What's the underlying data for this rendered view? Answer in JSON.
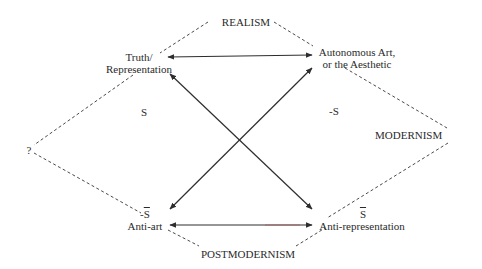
{
  "diagram": {
    "type": "semiotic square",
    "corners": {
      "top_left": {
        "line1": "Truth/",
        "line2": "Representation",
        "symbol": "S"
      },
      "top_right": {
        "line1": "Autonomous Art,",
        "line2": "or the Aesthetic",
        "symbol": "-S"
      },
      "bottom_left": {
        "line1": "Anti-art",
        "symbol": "-S̄",
        "symbol_text": "S"
      },
      "bottom_right": {
        "line1": "Anti-representation",
        "symbol": "S̄",
        "symbol_text": "S"
      }
    },
    "region_labels": {
      "top": "REALISM",
      "right": "MODERNISM",
      "bottom": "POSTMODERNISM",
      "left": "?"
    },
    "inner_labels": {
      "left": "S",
      "right": "-S"
    },
    "bottom_left_prefix": "-",
    "colors": {
      "line": "#2e2e2e",
      "text": "#2a2a2a",
      "bottom_arrow_tint": "#b04040"
    },
    "arrows": [
      {
        "from": "top_left",
        "to": "top_right",
        "bidirectional": true
      },
      {
        "from": "bottom_left",
        "to": "bottom_right",
        "bidirectional": true
      },
      {
        "from": "top_left",
        "to": "bottom_right",
        "bidirectional": true
      },
      {
        "from": "top_right",
        "to": "bottom_left",
        "bidirectional": true
      }
    ]
  }
}
